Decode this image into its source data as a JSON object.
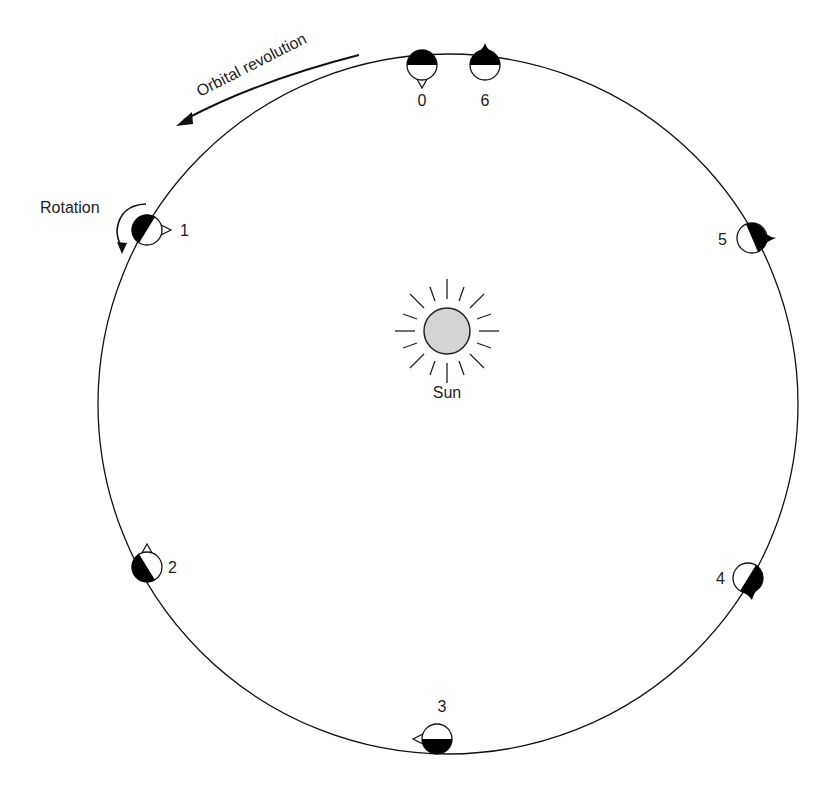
{
  "diagram": {
    "title_labels": {
      "orbital_revolution": "Orbital revolution",
      "rotation": "Rotation",
      "sun": "Sun"
    },
    "colors": {
      "line": "#111111",
      "sun_fill": "#d4d4d4",
      "dark_side": "#000000",
      "background": "#ffffff"
    },
    "orbit": {
      "cx": 448,
      "cy": 404,
      "r": 350
    },
    "planets": [
      {
        "label": "0",
        "x": 422,
        "y": 65,
        "marker": "white-triangle",
        "marker_direction": "down"
      },
      {
        "label": "1",
        "x": 147,
        "y": 230,
        "marker": "white-triangle",
        "marker_direction": "right"
      },
      {
        "label": "2",
        "x": 147,
        "y": 567,
        "marker": "white-triangle",
        "marker_direction": "up"
      },
      {
        "label": "3",
        "x": 437,
        "y": 739,
        "marker": "white-triangle",
        "marker_direction": "left"
      },
      {
        "label": "4",
        "x": 748,
        "y": 578,
        "marker": "black-bump",
        "marker_direction": "down"
      },
      {
        "label": "5",
        "x": 752,
        "y": 238,
        "marker": "black-bump",
        "marker_direction": "right"
      },
      {
        "label": "6",
        "x": 485,
        "y": 65,
        "marker": "black-bump",
        "marker_direction": "up"
      }
    ],
    "icons": {
      "sun": "sun-icon",
      "orbit_arrow": "curved-arrow-icon",
      "rotation_arrow": "curved-arrow-icon"
    }
  }
}
